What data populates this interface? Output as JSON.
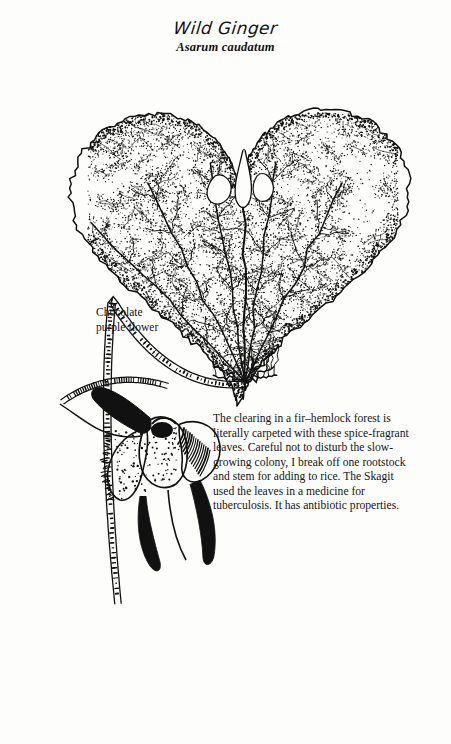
{
  "plate": {
    "common_name": "Wild Ginger",
    "latin_name": "Asarum caudatum",
    "background_color": "#fdfdfc",
    "ink_color": "#111111"
  },
  "annotation": {
    "label": "Chocolate\npurple flower",
    "target": "flower"
  },
  "description": {
    "text": "The clearing in a fir–hemlock forest is literally carpeted with these spice-fragrant leaves. Careful not to disturb the slow-growing colony, I break off one rootstock and stem for adding to rice. The Skagit used the leaves in a medicine for tuberculosis. It has antibiotic properties."
  },
  "figure_parts": {
    "leaf": "cordate-stippled-leaf",
    "petiole": "hatched-petiole",
    "flower": "chocolate-purple-flower",
    "rhizome": "segmented-rhizome",
    "rootlets": "fine-rootlets"
  }
}
